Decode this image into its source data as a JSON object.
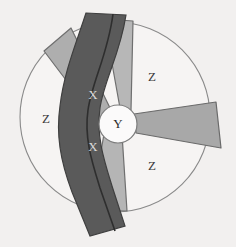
{
  "figure": {
    "background_color": "#f2f0ef",
    "outline_color": "#6b6b6b"
  },
  "shroud": {
    "name": "outer-circle",
    "cx": 115,
    "cy": 117,
    "r": 95,
    "fill": "#f6f4f3",
    "stroke": "#8a8a8a"
  },
  "hub": {
    "name": "center-hub",
    "label": "Y",
    "cx": 118,
    "cy": 124,
    "r": 19,
    "fill": "#fbfafa",
    "stroke": "#7d7d7d",
    "label_color": "#2b2b2b"
  },
  "blades": [
    {
      "name": "blade-upper-left",
      "label": "",
      "fill": "#aeaeae",
      "stroke": "#6f6f6f",
      "points": "112,112 71,28 44,51 97,121"
    },
    {
      "name": "blade-upper-right",
      "label": "",
      "fill": "#b7b7b7",
      "stroke": "#6f6f6f",
      "points": "120,108 104,19 133,21 131,110"
    },
    {
      "name": "blade-right",
      "label": "",
      "fill": "#a8a8a8",
      "stroke": "#6a6a6a",
      "points": "134,114 216,102 221,148 136,133"
    },
    {
      "name": "blade-lower",
      "label": "",
      "fill": "#b5b5b5",
      "stroke": "#6f6f6f",
      "points": "104,134 91,210 127,211 122,134"
    }
  ],
  "band": {
    "name": "dark-band",
    "fill": "#5a5a5a",
    "stroke": "#3f3f3f",
    "labels": [
      "X",
      "X"
    ],
    "label_color": "#d9d9d9"
  },
  "band_labels": [
    {
      "text": "X",
      "x": 93,
      "y": 96
    },
    {
      "text": "X",
      "x": 93,
      "y": 148
    }
  ],
  "region_labels": [
    {
      "name": "region-label-z-top-right",
      "text": "Z",
      "x": 152,
      "y": 78
    },
    {
      "name": "region-label-z-left",
      "text": "Z",
      "x": 46,
      "y": 120
    },
    {
      "name": "region-label-z-bottom-right",
      "text": "Z",
      "x": 152,
      "y": 167
    }
  ]
}
